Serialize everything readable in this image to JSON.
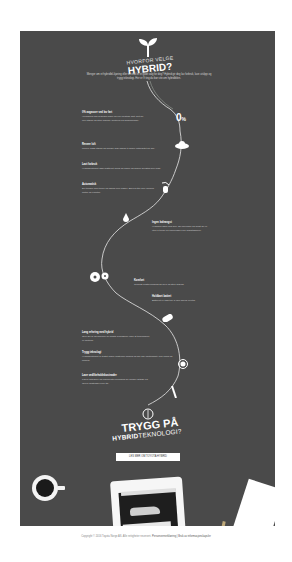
{
  "header": {
    "title_small": "HVORFOR VELGE",
    "title_big": "HYBRID?",
    "intro": "Menger om et hybridbil-kjøring eller en elbil er et godt valg for deg? Hybrid gir deg lav forbruk, lave utslipp og trygg teknologi. Her er 9 ting du bør vite om hybridbilen."
  },
  "path_icons": [
    {
      "name": "sprout-icon"
    },
    {
      "name": "zero-percent",
      "value": "0",
      "unit": "%"
    },
    {
      "name": "cloud-icon"
    },
    {
      "name": "signal-hand-icon"
    },
    {
      "name": "fuel-drop-icon"
    },
    {
      "name": "gears-icon"
    },
    {
      "name": "battery-icon"
    },
    {
      "name": "badge-icon"
    },
    {
      "name": "wrench-icon"
    },
    {
      "name": "brain-icon"
    }
  ],
  "sections": [
    {
      "heading": "0% avgasser ved lav fart",
      "body": "I bykjøring kan hybriden kjøre på ren elektrisk drift. Det gir null utslipp og stille kjøring i sentrum og boligområder."
    },
    {
      "heading": "Renere luft",
      "body": "Lavere CO2-utslipp og mindre NOx bidrar til bedre luftkvalitet for alle."
    },
    {
      "heading": "Lavt forbruk",
      "body": "Hybridsystemet lader batteriet mens du kjører og sparer drivstoff hver dag."
    },
    {
      "heading": "Automatisk",
      "body": "Du trenger ikke tenke på lading eller kabler. Bilen bytter selv mellom motor og elmotor."
    },
    {
      "heading": "Ingen ladeangst",
      "body": "Hybriden lader seg selv. Du kan kjøre så langt du vil uten å tenke på rekkevidde eller ladestasjoner."
    },
    {
      "heading": "Komfort",
      "body": "Trinnløs kraftoverføring gir myk og stille kjøring."
    },
    {
      "heading": "Holdbart batteri",
      "body": "Batteriet er laget for å vare bilens levetid."
    },
    {
      "heading": "Lang erfaring med hybrid",
      "body": "Over 20 år og millioner av solgte hybridbiler viser at teknologien er pålitelig."
    },
    {
      "heading": "Trygg teknologi",
      "body": "Hybridsystemet er testet under ekstreme forhold og har høy pålitelighet i alle klima og forhold."
    },
    {
      "heading": "Lave vedlikeholdskostnader",
      "body": "Færre slitedeler og regenerativ bremsing gir mindre slitasje og lavere kostnader over tid."
    }
  ],
  "closing": {
    "title_big": "TRYGG PÅ",
    "title_bold": "HYBRID",
    "title_rest": "TEKNOLOGI?",
    "cta_label": "LES MER OM TOYOTA HYBRID"
  },
  "footer": {
    "copyright": "Copyright © 2016 Toyota Norge AS. Alle rettigheter reservert.",
    "links": "Personvernerklæring | Bruk av informasjonskapsler"
  }
}
